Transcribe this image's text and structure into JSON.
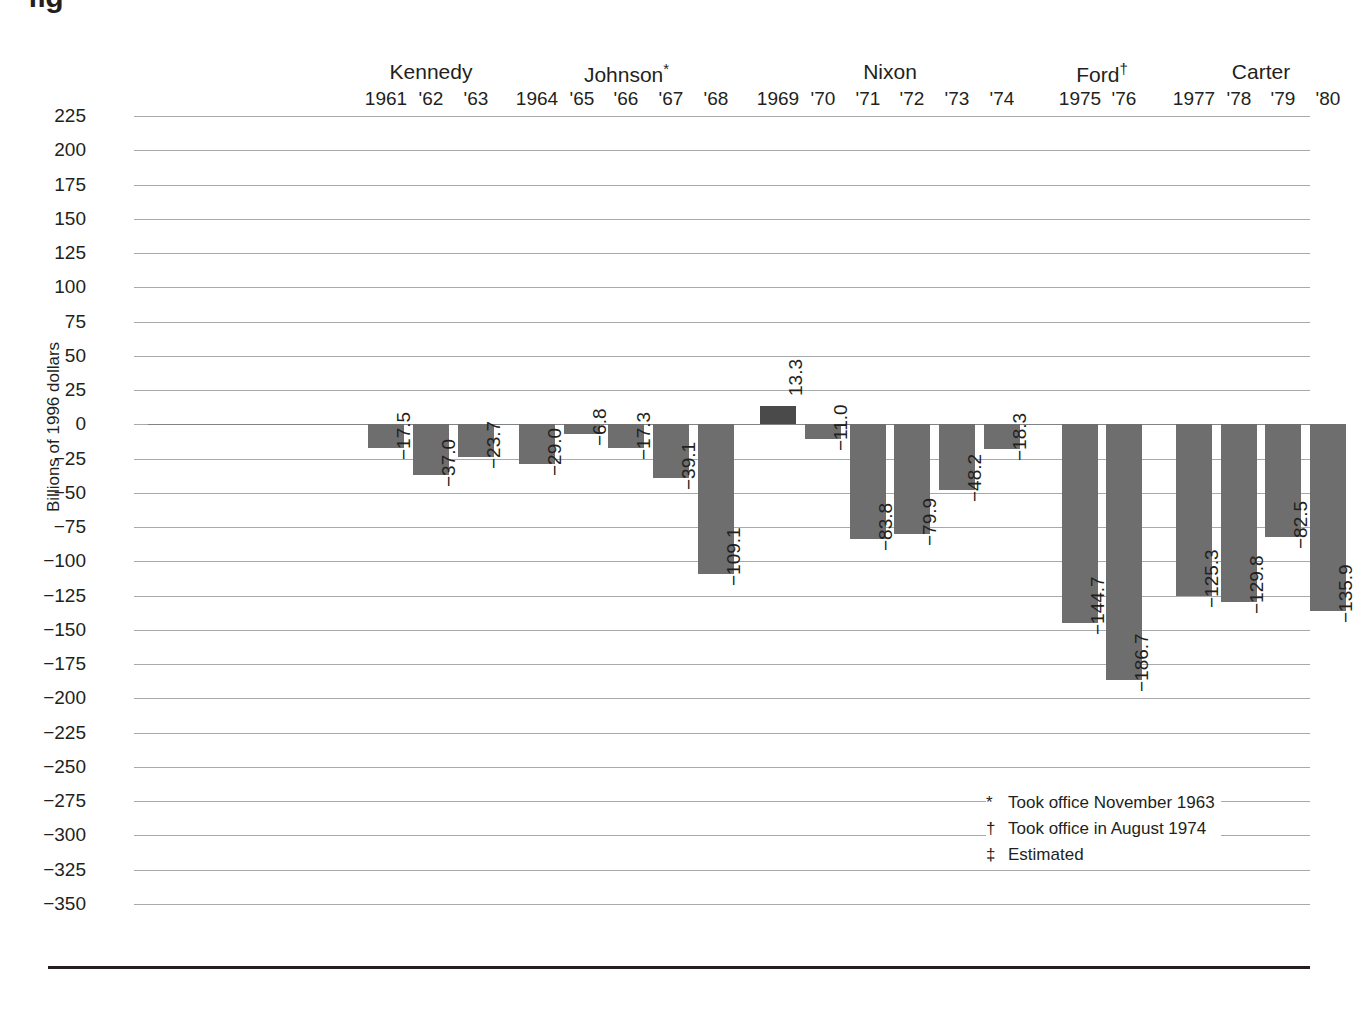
{
  "figure": {
    "label": "fig",
    "y_axis_title": "Billions of 1996 dollars"
  },
  "footnotes": [
    {
      "mark": "*",
      "text": "Took office November 1963"
    },
    {
      "mark": "†",
      "text": "Took office in August 1974"
    },
    {
      "mark": "‡",
      "text": "Estimated"
    }
  ],
  "colors": {
    "bar_negative": "#6e6e6e",
    "bar_positive": "#4a4a4a",
    "gridline": "#a7a9ac",
    "text": "#231f20"
  },
  "presidents": [
    {
      "name": "Kennedy",
      "marker": "",
      "first_index": 0,
      "last_index": 2
    },
    {
      "name": "Johnson",
      "marker": "*",
      "first_index": 3,
      "last_index": 7
    },
    {
      "name": "Nixon",
      "marker": "",
      "first_index": 8,
      "last_index": 13
    },
    {
      "name": "Ford",
      "marker": "†",
      "first_index": 14,
      "last_index": 15
    },
    {
      "name": "Carter",
      "marker": "",
      "first_index": 16,
      "last_index": 19
    }
  ],
  "chart_data": {
    "type": "bar",
    "title": "",
    "subtitle": "",
    "xlabel": "",
    "ylabel": "Billions of 1996 dollars",
    "ylim": [
      -350,
      225
    ],
    "ytick_step": 25,
    "yticks": [
      225,
      200,
      175,
      150,
      125,
      100,
      75,
      50,
      25,
      0,
      -25,
      -50,
      -75,
      -100,
      -125,
      -150,
      -175,
      -200,
      -225,
      -250,
      -275,
      -300,
      -325,
      -350
    ],
    "ytick_labels": [
      "225",
      "200",
      "175",
      "150",
      "125",
      "100",
      "75",
      "50",
      "25",
      "0",
      "−25",
      "−50",
      "−75",
      "−100",
      "−125",
      "−150",
      "−175",
      "−200",
      "−225",
      "−250",
      "−275",
      "−300",
      "−325",
      "−350"
    ],
    "grid": true,
    "legend": "none",
    "categories": [
      "1961",
      "'62",
      "'63",
      "1964",
      "'65",
      "'66",
      "'67",
      "'68",
      "1969",
      "'70",
      "'71",
      "'72",
      "'73",
      "'74",
      "1975",
      "'76",
      "1977",
      "'78",
      "'79",
      "'80"
    ],
    "values": [
      -17.5,
      -37.0,
      -23.7,
      -29.0,
      -6.8,
      -17.3,
      -39.1,
      -109.1,
      13.3,
      -11.0,
      -83.8,
      -79.9,
      -48.2,
      -18.3,
      -144.7,
      -186.7,
      -125.3,
      -129.8,
      -82.5,
      -135.9
    ],
    "value_labels": [
      "−17.5",
      "−37.0",
      "−23.7",
      "−29.0",
      "−6.8",
      "−17.3",
      "−39.1",
      "−109.1",
      "13.3",
      "−11.0",
      "−83.8",
      "−79.9",
      "−48.2",
      "−18.3",
      "−144.7",
      "−186.7",
      "−125.3",
      "−129.8",
      "−82.5",
      "−135.9"
    ],
    "bar_centers_px": [
      238,
      283,
      328,
      389,
      434,
      478,
      523,
      568,
      630,
      675,
      720,
      764,
      809,
      854,
      932,
      976,
      1046,
      1091,
      1135,
      1180
    ],
    "group_of": [
      "Kennedy",
      "Kennedy",
      "Kennedy",
      "Johnson",
      "Johnson",
      "Johnson",
      "Johnson",
      "Johnson",
      "Nixon",
      "Nixon",
      "Nixon",
      "Nixon",
      "Nixon",
      "Nixon",
      "Ford",
      "Ford",
      "Carter",
      "Carter",
      "Carter",
      "Carter"
    ]
  }
}
